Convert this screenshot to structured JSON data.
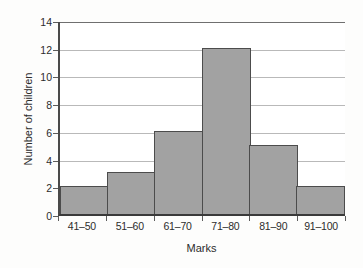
{
  "chart_data": {
    "type": "bar",
    "title": "",
    "subtitle": "",
    "xlabel": "Marks",
    "ylabel": "Number of children",
    "categories": [
      "41–50",
      "51–60",
      "61–70",
      "71–80",
      "81–90",
      "91–100"
    ],
    "values": [
      2,
      3,
      6,
      12,
      5,
      2
    ],
    "series": [
      {
        "name": "Number of children",
        "values": [
          2,
          3,
          6,
          12,
          5,
          2
        ]
      }
    ],
    "ylim": [
      0,
      14
    ],
    "ytick_labels": [
      "0",
      "2",
      "4",
      "6",
      "8",
      "10",
      "12",
      "14"
    ],
    "ytick_values": [
      0,
      2,
      4,
      6,
      8,
      10,
      12,
      14
    ],
    "ytick_step": 2,
    "xtick_labels": [
      "41–50",
      "51–60",
      "61–70",
      "71–80",
      "81–90",
      "91–100"
    ],
    "grid": true,
    "grid_axis": "y",
    "legend": false,
    "legend_position": "none",
    "annotations": [],
    "bar_gap": 0,
    "colors": {
      "bar_fill": "#a2a2a2",
      "bar_border": "#4c4c4c",
      "gridline": "#b9b9b9",
      "axis": "#4a4a4a",
      "text": "#2c2c2c",
      "plot_background": "#ffffff",
      "figure_background": "#fdfdfc"
    }
  }
}
